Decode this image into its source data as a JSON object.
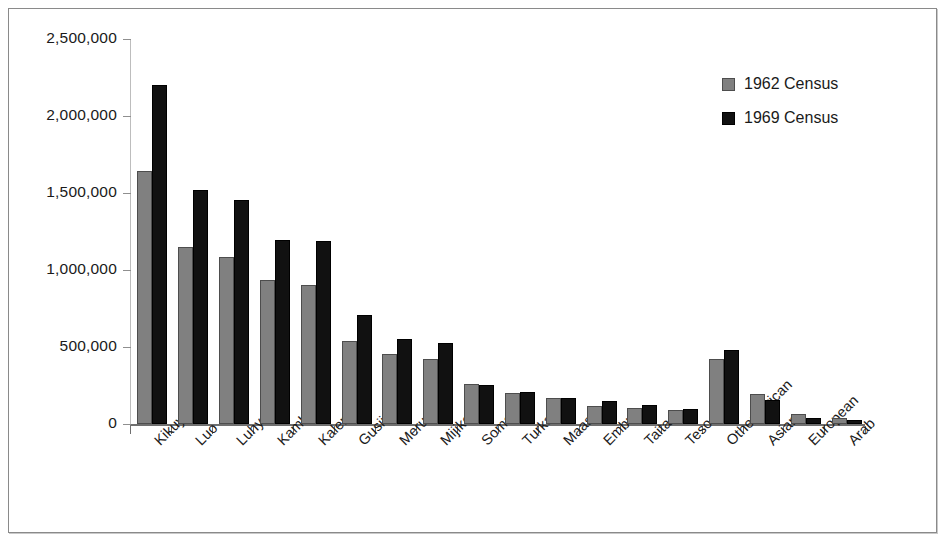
{
  "chart_data": {
    "type": "bar",
    "title": "",
    "subtitle": "",
    "xlabel": "",
    "ylabel": "",
    "ylim": [
      0,
      2500000
    ],
    "ytick_labels": [
      "2,500,000",
      "2,000,000",
      "1,500,000",
      "1,000,000",
      "500,000",
      "0"
    ],
    "ytick_values": [
      2500000,
      2000000,
      1500000,
      1000000,
      500000,
      0
    ],
    "grid": false,
    "legend_position": "top-right",
    "categories": [
      "Kikuyu",
      "Luo",
      "Luhya",
      "Kamba",
      "Kalenjin",
      "Gusii/Kisii",
      "Meru",
      "Mijikenda",
      "Somali",
      "Turkana",
      "Maasai",
      "Embu",
      "Taita",
      "Teso",
      "Other African",
      "Asian",
      "European",
      "Arab"
    ],
    "series": [
      {
        "name": "1962 Census",
        "color": "#808080",
        "values": [
          1642000,
          1148000,
          1086000,
          933000,
          900000,
          538000,
          452000,
          420000,
          260000,
          203000,
          170000,
          120000,
          102000,
          88000,
          420000,
          195000,
          65000,
          42000
        ]
      },
      {
        "name": "1969 Census",
        "color": "#111111",
        "values": [
          2200000,
          1521000,
          1453000,
          1197000,
          1190000,
          705000,
          555000,
          525000,
          256000,
          208000,
          170000,
          148000,
          124000,
          96000,
          480000,
          155000,
          42000,
          28000
        ]
      }
    ]
  },
  "legend": {
    "entries": [
      {
        "label": "1962 Census",
        "swatch": "gray-square-swatch"
      },
      {
        "label": "1969 Census",
        "swatch": "black-square-swatch"
      }
    ]
  }
}
